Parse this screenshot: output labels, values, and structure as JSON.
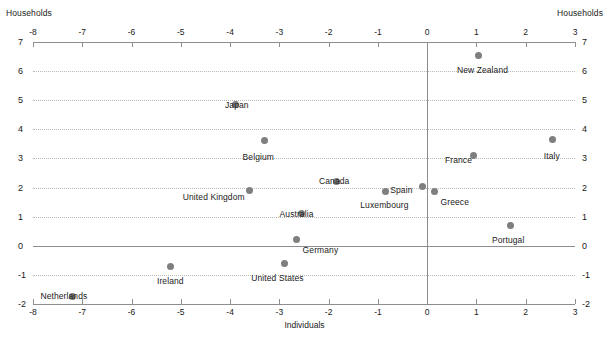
{
  "chart_data": {
    "type": "scatter",
    "title": "",
    "xlabel": "Individuals",
    "ylabel": "Households",
    "ylabel_right": "Households",
    "xlim": [
      -8,
      3
    ],
    "ylim": [
      -2,
      7
    ],
    "xticks": [
      -8,
      -7,
      -6,
      -5,
      -4,
      -3,
      -2,
      -1,
      0,
      1,
      2,
      3
    ],
    "xtick_labels": [
      "-8",
      "-7",
      "-6",
      "-5",
      "-4",
      "-3",
      "-2",
      "-1",
      "0",
      "1",
      "2",
      "3"
    ],
    "yticks": [
      7,
      6,
      5,
      4,
      3,
      2,
      1,
      0,
      -1,
      -2
    ],
    "ytick_labels": [
      "7",
      "6",
      "5",
      "4",
      "3",
      "2",
      "1",
      "0",
      "-1",
      "-2"
    ],
    "grid": "horizontal-dotted",
    "legend": "none",
    "point_color": "#7f7f7f",
    "points": [
      {
        "label": "New Zealand",
        "x": 1.05,
        "y": 6.55,
        "label_dx": -22,
        "label_dy": 10
      },
      {
        "label": "Italy",
        "x": 2.55,
        "y": 3.65,
        "label_dx": -9,
        "label_dy": 11
      },
      {
        "label": "Japan",
        "x": -3.9,
        "y": 4.85,
        "label_dx": -10,
        "label_dy": -5
      },
      {
        "label": "Belgium",
        "x": -3.3,
        "y": 3.6,
        "label_dx": -22,
        "label_dy": 11
      },
      {
        "label": "France",
        "x": 0.95,
        "y": 3.1,
        "label_dx": -29,
        "label_dy": -1
      },
      {
        "label": "Canada",
        "x": -1.85,
        "y": 2.2,
        "label_dx": -17,
        "label_dy": -6
      },
      {
        "label": "United Kingdom",
        "x": -3.6,
        "y": 1.9,
        "label_dx": -67,
        "label_dy": 2
      },
      {
        "label": "Spain",
        "x": -0.1,
        "y": 2.05,
        "label_dx": -32,
        "label_dy": -1
      },
      {
        "label": "Greece",
        "x": 0.15,
        "y": 1.85,
        "label_dx": 6,
        "label_dy": 5
      },
      {
        "label": "Luxembourg",
        "x": -0.85,
        "y": 1.85,
        "label_dx": -25,
        "label_dy": 8
      },
      {
        "label": "Australia",
        "x": -2.55,
        "y": 1.1,
        "label_dx": -22,
        "label_dy": -5
      },
      {
        "label": "Portugal",
        "x": 1.7,
        "y": 0.7,
        "label_dx": -19,
        "label_dy": 10
      },
      {
        "label": "Germany",
        "x": -2.65,
        "y": 0.2,
        "label_dx": 6,
        "label_dy": 5
      },
      {
        "label": "United States",
        "x": -2.9,
        "y": -0.6,
        "label_dx": -33,
        "label_dy": 10
      },
      {
        "label": "Ireland",
        "x": -5.2,
        "y": -0.7,
        "label_dx": -14,
        "label_dy": 10
      },
      {
        "label": "Netherlands",
        "x": -7.2,
        "y": -1.75,
        "label_dx": -32,
        "label_dy": -6
      }
    ]
  }
}
